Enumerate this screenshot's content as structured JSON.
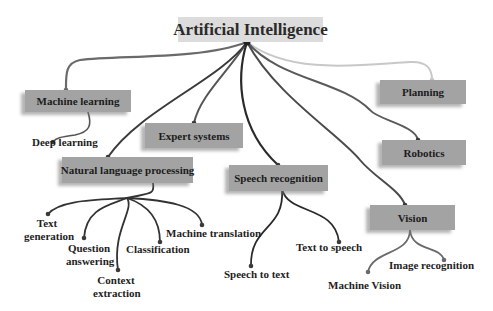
{
  "title": "Artificial Intelligence",
  "colors": {
    "node_fill": "#a3a3a3",
    "root_fill": "#dcdcdc",
    "link_dark": "#2f2f2f",
    "link_mid": "#5a5a5a",
    "link_light": "#c8c8c8"
  },
  "branches": [
    {
      "label": "Machine learning",
      "children": [
        "Deep learning"
      ]
    },
    {
      "label": "Expert systems",
      "children": []
    },
    {
      "label": "Natural language processing",
      "children": [
        "Text generation",
        "Question answering",
        "Context extraction",
        "Classification",
        "Machine translation"
      ]
    },
    {
      "label": "Speech recognition",
      "children": [
        "Speech to text",
        "Text to speech"
      ]
    },
    {
      "label": "Planning",
      "children": []
    },
    {
      "label": "Robotics",
      "children": []
    },
    {
      "label": "Vision",
      "children": [
        "Machine Vision",
        "Image recognition"
      ]
    }
  ],
  "leaves": {
    "deep_learning": "Deep learning",
    "text_generation_1": "Text",
    "text_generation_2": "generation",
    "question_answering_1": "Question",
    "question_answering_2": "answering",
    "context_extraction_1": "Context",
    "context_extraction_2": "extraction",
    "classification": "Classification",
    "machine_translation": "Machine translation",
    "speech_to_text": "Speech to text",
    "text_to_speech": "Text to speech",
    "machine_vision": "Machine Vision",
    "image_recognition": "Image recognition"
  }
}
